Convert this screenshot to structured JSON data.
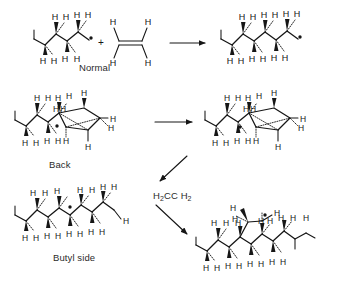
{
  "figure": {
    "background_color": "#ffffff",
    "ink_color": "#161616",
    "width": 338,
    "height": 288
  },
  "labels": {
    "normal": "Normal",
    "back": "Back",
    "butyl_side": "Butyl side",
    "monomer_formula_part1": "H",
    "monomer_sub1": "2",
    "monomer_formula_part2": "CC H",
    "monomer_sub2": "2",
    "monomer_plain": "H2CC H2",
    "plus": "+",
    "hydrogen": "H"
  },
  "rows": [
    {
      "id": "row-normal",
      "label": "Normal",
      "reactants": [
        "secondary-alkyl-radical",
        "ethylene"
      ],
      "product": "chain-extended-radical",
      "arrow": "right"
    },
    {
      "id": "row-back",
      "label": "Back",
      "reactants": [
        "backbiting-cyclic-transition-state"
      ],
      "product": "backbiting-cyclic-transition-state-shifted",
      "arrow": "right"
    },
    {
      "id": "row-butyl",
      "label": "Butyl side",
      "reactants": [
        "mid-chain-radical"
      ],
      "product": "branched-radical-with-ethyl",
      "arrow": "diagonal-down-right",
      "arrow_label": "H2CC H2"
    }
  ],
  "structures": {
    "secondary_alkyl_radical": {
      "name": "secondary-alkyl-radical",
      "top_hydrogens": [
        "H",
        "H",
        "H",
        "H"
      ],
      "bottom_hydrogens": [
        "H",
        "H",
        "H",
        "H"
      ],
      "radical_dot": true
    },
    "ethylene": {
      "name": "ethylene-monomer",
      "hydrogens": [
        "H",
        "H",
        "H",
        "H"
      ],
      "bond": "double",
      "caption": "Normal"
    },
    "chain_extended_radical": {
      "name": "chain-extended-radical",
      "top_hydrogens": [
        "H",
        "H",
        "H",
        "H",
        "H",
        "H"
      ],
      "bottom_hydrogens": [
        "H",
        "H",
        "H",
        "H",
        "H",
        "H"
      ],
      "radical_dot": true
    },
    "backbiting_ts_left": {
      "name": "backbiting-cyclic-transition-state",
      "top_hydrogens": [
        "H",
        "H",
        "H",
        "H",
        "H",
        "H",
        "H"
      ],
      "bottom_hydrogens": [
        "H",
        "H",
        "H",
        "H",
        "H",
        "H",
        "H"
      ],
      "radical_dot": true,
      "caption": "Back"
    },
    "backbiting_ts_right": {
      "name": "backbiting-cyclic-transition-state-shifted",
      "top_hydrogens": [
        "H",
        "H",
        "H",
        "H",
        "H",
        "H",
        "H"
      ],
      "bottom_hydrogens": [
        "H",
        "H",
        "H",
        "H",
        "H",
        "H",
        "H"
      ],
      "radical_dot": true
    },
    "mid_chain_radical": {
      "name": "mid-chain-radical",
      "top_hydrogens": [
        "H",
        "H",
        "H",
        "H",
        "H",
        "H",
        "H"
      ],
      "bottom_hydrogens": [
        "H",
        "H",
        "H",
        "H",
        "H",
        "H",
        "H",
        "H"
      ],
      "radical_dot": true,
      "caption": "Butyl side"
    },
    "branched_radical": {
      "name": "branched-radical-with-ethyl",
      "top_hydrogens": [
        "H",
        "H",
        "H",
        "H",
        "H",
        "H",
        "H",
        "H",
        "H",
        "H",
        "H"
      ],
      "bottom_hydrogens": [
        "H",
        "H",
        "H",
        "H",
        "H",
        "H",
        "H",
        "H"
      ],
      "radical_dot": true
    }
  }
}
